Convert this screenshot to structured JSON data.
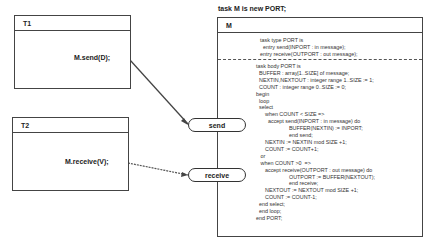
{
  "title": "task M is new PORT;",
  "tasks": [
    {
      "name": "T1",
      "call": "M.send(D);"
    },
    {
      "name": "T2",
      "call": "M.receive(V);"
    }
  ],
  "server": {
    "name": "M",
    "spec_lines": "task type PORT is\n  entry send(INPORT : in message);\nentry receive(OUTPORT : out message);",
    "body_lines": "task body PORT is\n  BUFFER : array[1..SIZE] of message;\n  NEXTIN,NEXTOUT : integer range 1..SIZE := 1;\n  COUNT : integer range 0..SIZE := 0;\nbegin\n  loop\n  select\n      when COUNT < SIZE =>\n        accept send(INPORT : in message) do\n                      BUFFER(NEXTIN) := INPORT;\n                      end send;\n      NEXTIN := NEXTIN mod SIZE +1;\n      COUNT := COUNT+1;\n   or\n   when COUNT >0  =>\n      accept receive(OUTPORT : out message) do\n                      OUTPORT := BUFFER(NEXTOUT);\n                      end receive;\n      NEXTOUT := NEXTOUT mod SIZE +1;\n      COUNT := COUNT-1;\n  end select;\n  end loop;\nend PORT;"
  },
  "entries": [
    {
      "label": "send"
    },
    {
      "label": "receive"
    }
  ]
}
